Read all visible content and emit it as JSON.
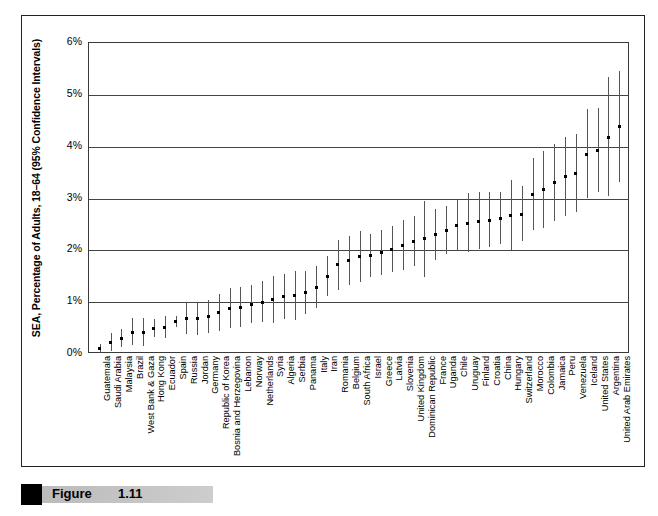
{
  "figure": {
    "caption_label": "Figure",
    "caption_number": "1.11"
  },
  "chart_data": {
    "type": "scatter",
    "title": "",
    "xlabel": "",
    "ylabel": "SEA, Percentage of Adults, 18–64 (95% Confidence Intervals)",
    "ylim": [
      0,
      6
    ],
    "ytick_labels": [
      "6%",
      "5%",
      "4%",
      "3%",
      "2%",
      "1%",
      "0%"
    ],
    "ytick_values": [
      6,
      5,
      4,
      3,
      2,
      1,
      0
    ],
    "grid": true,
    "legend": "none",
    "error_bars": "95% confidence intervals",
    "categories": [
      "Guatemala",
      "Saudi Arabia",
      "Malaysia",
      "Brazil",
      "West Bank & Gaza",
      "Hong Kong",
      "Ecuador",
      "Spain",
      "Russia",
      "Jordan",
      "Germany",
      "Republic of Korea",
      "Bosnia and Herzegovina",
      "Lebanon",
      "Norway",
      "Netherlands",
      "Syria",
      "Algeria",
      "Serbia",
      "Panama",
      "Italy",
      "Iran",
      "Romania",
      "Belgium",
      "South Africa",
      "Israel",
      "Greece",
      "Latvia",
      "Slovenia",
      "United Kingdom",
      "Dominican Republic",
      "France",
      "Uganda",
      "Chile",
      "Uruguay",
      "Finland",
      "Croatia",
      "China",
      "Hungary",
      "Switzerland",
      "Morocco",
      "Colombia",
      "Jamaica",
      "Peru",
      "Venezuela",
      "Iceland",
      "United States",
      "Argentina",
      "United Arab Emirates"
    ],
    "values": [
      0.1,
      0.22,
      0.3,
      0.42,
      0.42,
      0.5,
      0.52,
      0.62,
      0.68,
      0.68,
      0.72,
      0.8,
      0.88,
      0.9,
      0.96,
      1.0,
      1.05,
      1.1,
      1.12,
      1.18,
      1.28,
      1.5,
      1.72,
      1.8,
      1.88,
      1.9,
      1.96,
      2.02,
      2.1,
      2.18,
      2.22,
      2.3,
      2.38,
      2.48,
      2.52,
      2.56,
      2.58,
      2.62,
      2.68,
      2.7,
      3.08,
      3.18,
      3.3,
      3.42,
      3.48,
      3.85,
      3.92,
      4.18,
      4.38
    ],
    "ci_low": [
      0.02,
      0.06,
      0.14,
      0.18,
      0.16,
      0.33,
      0.3,
      0.52,
      0.38,
      0.36,
      0.4,
      0.44,
      0.5,
      0.52,
      0.6,
      0.62,
      0.6,
      0.68,
      0.66,
      0.78,
      0.88,
      1.12,
      1.24,
      1.34,
      1.38,
      1.48,
      1.52,
      1.58,
      1.62,
      1.7,
      1.48,
      1.82,
      1.92,
      1.98,
      1.96,
      2.02,
      2.06,
      2.12,
      2.0,
      2.18,
      2.4,
      2.44,
      2.56,
      2.66,
      2.74,
      3.0,
      3.12,
      3.04,
      3.32
    ],
    "ci_high": [
      0.2,
      0.4,
      0.48,
      0.7,
      0.7,
      0.68,
      0.74,
      0.74,
      1.0,
      1.0,
      1.04,
      1.16,
      1.28,
      1.3,
      1.34,
      1.4,
      1.5,
      1.54,
      1.6,
      1.6,
      1.7,
      1.9,
      2.2,
      2.28,
      2.38,
      2.32,
      2.4,
      2.46,
      2.58,
      2.66,
      2.96,
      2.8,
      2.86,
      2.98,
      3.1,
      3.12,
      3.12,
      3.12,
      3.36,
      3.24,
      3.78,
      3.92,
      4.06,
      4.18,
      4.24,
      4.72,
      4.74,
      5.34,
      5.46
    ]
  }
}
